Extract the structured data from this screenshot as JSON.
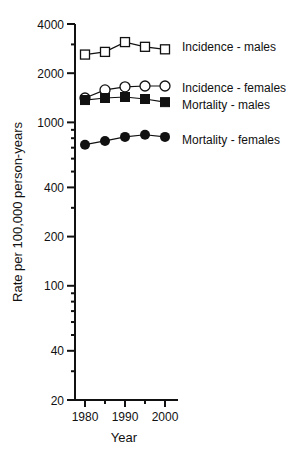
{
  "chart_data": {
    "type": "line",
    "title": "",
    "xlabel": "Year",
    "ylabel": "Rate per 100,000 person-years",
    "yscale": "log",
    "ylim": [
      20,
      4000
    ],
    "xlim": [
      1980,
      2000
    ],
    "x": [
      1980,
      1985,
      1990,
      1995,
      2000
    ],
    "x_ticks": [
      1980,
      1990,
      2000
    ],
    "x_minor_ticks": [
      1985,
      1995
    ],
    "y_ticks": [
      20,
      40,
      100,
      200,
      400,
      1000,
      2000,
      4000
    ],
    "y_tick_labels": [
      "20",
      "40",
      "100",
      "200",
      "400",
      "1000",
      "2000",
      "4000"
    ],
    "y_minor_ticks": [
      30,
      50,
      60,
      70,
      80,
      90,
      300,
      500,
      600,
      700,
      800,
      900,
      3000
    ],
    "grid": false,
    "legend_position": "right, inline labels next to line ends",
    "series": [
      {
        "name": "Incidence - males",
        "marker": "open-square",
        "values": [
          2600,
          2700,
          3100,
          2900,
          2800
        ]
      },
      {
        "name": "Incidence - females",
        "marker": "open-circle",
        "values": [
          1410,
          1580,
          1650,
          1670,
          1670
        ]
      },
      {
        "name": "Mortality - males",
        "marker": "filled-square",
        "values": [
          1370,
          1410,
          1430,
          1390,
          1330
        ]
      },
      {
        "name": "Mortality - females",
        "marker": "filled-circle",
        "values": [
          730,
          770,
          815,
          840,
          815
        ]
      }
    ]
  },
  "colors": {
    "ink": "#111111",
    "background": "#ffffff"
  }
}
